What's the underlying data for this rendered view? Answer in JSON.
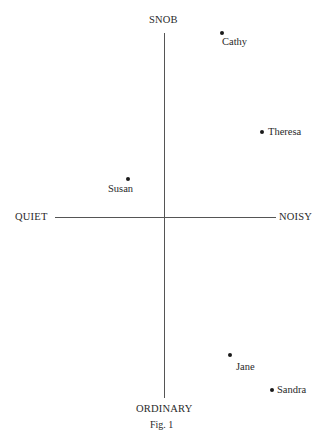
{
  "diagram": {
    "axes": {
      "top": "SNOB",
      "bottom": "ORDINARY",
      "left": "QUIET",
      "right": "NOISY"
    },
    "points": [
      {
        "name": "Cathy"
      },
      {
        "name": "Theresa"
      },
      {
        "name": "Susan"
      },
      {
        "name": "Jane"
      },
      {
        "name": "Sandra"
      }
    ],
    "caption": "Fig. 1"
  }
}
